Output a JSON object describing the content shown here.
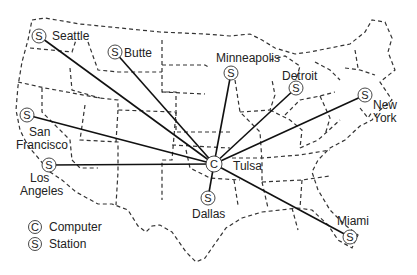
{
  "diagram": {
    "type": "network-map",
    "hub": {
      "id": "tulsa",
      "label": "Tulsa",
      "glyph": "C",
      "x": 214,
      "y": 164
    },
    "stations": [
      {
        "id": "seattle",
        "label": "Seattle",
        "glyph": "S",
        "x": 39,
        "y": 36
      },
      {
        "id": "butte",
        "label": "Butte",
        "glyph": "S",
        "x": 115,
        "y": 52
      },
      {
        "id": "minneapolis",
        "label": "Minneapolis",
        "glyph": "S",
        "x": 231,
        "y": 73
      },
      {
        "id": "detroit",
        "label": "Detroit",
        "glyph": "S",
        "x": 296,
        "y": 88
      },
      {
        "id": "new-york",
        "label_line1": "New",
        "label_line2": "York",
        "glyph": "S",
        "x": 365,
        "y": 95
      },
      {
        "id": "san-francisco",
        "label_line1": "San",
        "label_line2": "Francisco",
        "glyph": "S",
        "x": 27,
        "y": 115
      },
      {
        "id": "los-angeles",
        "label_line1": "Los",
        "label_line2": "Angeles",
        "glyph": "S",
        "x": 49,
        "y": 165
      },
      {
        "id": "dallas",
        "label": "Dallas",
        "glyph": "S",
        "x": 208,
        "y": 198
      },
      {
        "id": "miami",
        "label": "Miami",
        "glyph": "S",
        "x": 350,
        "y": 237
      }
    ],
    "legend": {
      "items": [
        {
          "glyph": "C",
          "label": "Computer"
        },
        {
          "glyph": "S",
          "label": "Station"
        }
      ]
    }
  }
}
